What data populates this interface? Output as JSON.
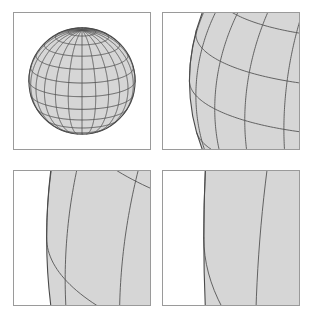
{
  "figure": {
    "background_color": "#ffffff",
    "panel_count": 4,
    "grid_rows": 2,
    "grid_cols": 2
  },
  "style": {
    "panel_border_color": "#9a9a9a",
    "panel_border_width": 1,
    "panel_background": "#ffffff",
    "sphere_fill": "#d6d6d6",
    "sphere_fill_shaded": "#cfcfcf",
    "grid_line_color": "#555555",
    "grid_line_color_light": "#6f6f6f",
    "outline_color": "#4a4a4a",
    "limb_shade_color": "#8f8f8f"
  },
  "sphere": {
    "meridian_count": 24,
    "parallel_count": 12,
    "projection": "orthographic",
    "shading": "flat-grey"
  },
  "panels": [
    {
      "id": "panel-1",
      "name": "sphere-overview",
      "label": "Full sphere",
      "zoom_level": 1,
      "x": 13,
      "y": 12,
      "width": 138,
      "height": 138,
      "view": {
        "center_x": 0.0,
        "center_y": 0.0,
        "half_width": 1.28,
        "note": "Entire sphere of unit radius visible, centred in the frame."
      }
    },
    {
      "id": "panel-2",
      "name": "sphere-limb-zoom-1",
      "label": "Left limb, 4x",
      "zoom_level": 4,
      "x": 162,
      "y": 12,
      "width": 138,
      "height": 138,
      "view": {
        "center_x": -0.78,
        "center_y": 0.0,
        "half_width": 0.36,
        "note": "Left edge of the sphere; limb still visibly curved."
      }
    },
    {
      "id": "panel-3",
      "name": "sphere-limb-zoom-2",
      "label": "Left limb, 12x",
      "zoom_level": 12,
      "x": 13,
      "y": 170,
      "width": 138,
      "height": 136,
      "view": {
        "center_x": -0.935,
        "center_y": 0.0,
        "half_width": 0.125,
        "note": "Deeper zoom; limb curvature reduced, meridians bunch at the edge."
      }
    },
    {
      "id": "panel-4",
      "name": "sphere-limb-zoom-3",
      "label": "Left limb, 36x",
      "zoom_level": 36,
      "x": 162,
      "y": 170,
      "width": 138,
      "height": 136,
      "view": {
        "center_x": -0.982,
        "center_y": 0.0,
        "half_width": 0.045,
        "note": "Deepest zoom; limb appears almost as a straight vertical line."
      }
    }
  ]
}
